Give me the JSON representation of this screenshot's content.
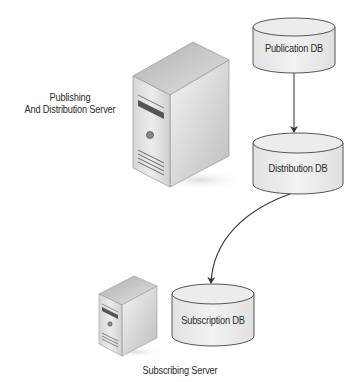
{
  "diagram": {
    "nodes": {
      "publishing_server": {
        "label_line1": "Publishing",
        "label_line2": "And Distribution Server",
        "shape": "server-tower"
      },
      "publication_db": {
        "label": "Publication DB",
        "shape": "cylinder"
      },
      "distribution_db": {
        "label": "Distribution DB",
        "shape": "cylinder"
      },
      "subscription_db": {
        "label": "Subscription DB",
        "shape": "cylinder"
      },
      "subscribing_server": {
        "label": "Subscribing Server",
        "shape": "server-tower"
      }
    },
    "edges": [
      {
        "from": "publication_db",
        "to": "distribution_db",
        "style": "straight-arrow"
      },
      {
        "from": "distribution_db",
        "to": "subscription_db",
        "style": "curved-arrow"
      }
    ],
    "colors": {
      "background": "#ffffff",
      "cylinder_fill": "#ebebeb",
      "cylinder_stroke": "#555555",
      "arrow": "#333333",
      "text": "#2a2a2a"
    }
  }
}
